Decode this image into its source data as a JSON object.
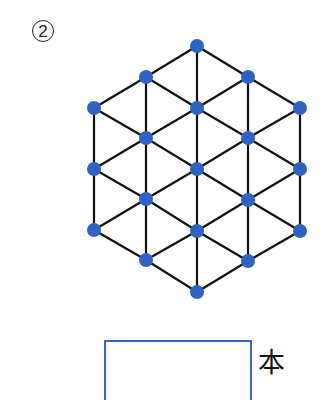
{
  "problem": {
    "number_label": "2",
    "marker": "circled-number"
  },
  "figure": {
    "type": "hexagonal-triangular-lattice",
    "node_color": "#2e62c4",
    "edge_color": "#111111",
    "node_radius": 7,
    "node_count": 19,
    "columns": [
      {
        "x": 94,
        "ys": [
          108,
          169,
          230
        ]
      },
      {
        "x": 146,
        "ys": [
          77,
          138,
          199,
          260
        ]
      },
      {
        "x": 197,
        "ys": [
          46,
          108,
          169,
          231,
          292
        ]
      },
      {
        "x": 248,
        "ys": [
          77,
          138,
          200,
          261
        ]
      },
      {
        "x": 300,
        "ys": [
          108,
          169,
          231
        ]
      }
    ]
  },
  "answer": {
    "value": "",
    "unit": "本",
    "border_color": "#3a66c2"
  }
}
